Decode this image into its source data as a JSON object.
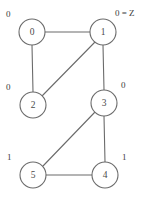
{
  "figure": {
    "kind": "undirected-graph-diagram",
    "width": 153,
    "height": 198,
    "background_color": "#ffffff",
    "stroke_color": "#6b6b6b",
    "text_color": "#4a4a4a"
  },
  "nodes": [
    {
      "id": "0",
      "label": "0",
      "cx": 32,
      "cy": 32,
      "r": 13
    },
    {
      "id": "1",
      "label": "1",
      "cx": 103,
      "cy": 32,
      "r": 13
    },
    {
      "id": "2",
      "label": "2",
      "cx": 33,
      "cy": 105,
      "r": 13
    },
    {
      "id": "3",
      "label": "3",
      "cx": 104,
      "cy": 103,
      "r": 13
    },
    {
      "id": "4",
      "label": "4",
      "cx": 105,
      "cy": 175,
      "r": 13
    },
    {
      "id": "5",
      "label": "5",
      "cx": 33,
      "cy": 175,
      "r": 13
    }
  ],
  "edges": [
    {
      "from": "0",
      "to": "1",
      "x1": 45,
      "y1": 32,
      "x2": 90,
      "y2": 32
    },
    {
      "from": "0",
      "to": "2",
      "x1": 32,
      "y1": 45,
      "x2": 33,
      "y2": 92
    },
    {
      "from": "2",
      "to": "1",
      "x1": 42,
      "y1": 96,
      "x2": 95,
      "y2": 42
    },
    {
      "from": "1",
      "to": "3",
      "x1": 103,
      "y1": 45,
      "x2": 104,
      "y2": 90
    },
    {
      "from": "3",
      "to": "5",
      "x1": 95,
      "y1": 112,
      "x2": 43,
      "y2": 166
    },
    {
      "from": "3",
      "to": "4",
      "x1": 104,
      "y1": 116,
      "x2": 105,
      "y2": 162
    },
    {
      "from": "5",
      "to": "4",
      "x1": 46,
      "y1": 175,
      "x2": 92,
      "y2": 175
    }
  ],
  "annotations": [
    {
      "id": "label-node-0",
      "node": "0",
      "text": "0",
      "x": 6,
      "y": 15,
      "side": "left"
    },
    {
      "id": "label-node-1",
      "node": "1",
      "text": "0 = Z",
      "x": 115,
      "y": 14,
      "side": "right"
    },
    {
      "id": "label-node-2",
      "node": "2",
      "text": "0",
      "x": 6,
      "y": 88,
      "side": "left"
    },
    {
      "id": "label-node-3",
      "node": "3",
      "text": "0",
      "x": 121,
      "y": 86,
      "side": "right"
    },
    {
      "id": "label-node-5",
      "node": "5",
      "text": "1",
      "x": 7,
      "y": 158,
      "side": "left"
    },
    {
      "id": "label-node-4",
      "node": "4",
      "text": "1",
      "x": 122,
      "y": 158,
      "side": "right"
    }
  ]
}
